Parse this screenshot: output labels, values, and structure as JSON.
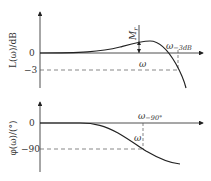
{
  "top_plot": {
    "ylabel": "L(ω)/dB",
    "ticks": [
      "0",
      "−3"
    ],
    "peak_label": "M",
    "peak_sub": "r",
    "omega_label": "ω",
    "cutoff_label": "ω",
    "cutoff_sub": "−3dB"
  },
  "bottom_plot": {
    "ylabel": "φ(ω)/(°)",
    "ticks": [
      "0",
      "−90"
    ],
    "omega_label": "ω",
    "cross_label": "ω",
    "cross_sub": "−90°"
  },
  "colors": {
    "line": "#222222",
    "dash": "#555555"
  }
}
